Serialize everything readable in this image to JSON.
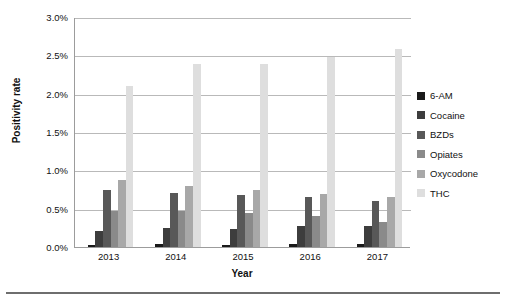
{
  "chart_data": {
    "type": "bar",
    "title": "",
    "xlabel": "Year",
    "ylabel": "Positivity rate",
    "categories": [
      "2013",
      "2014",
      "2015",
      "2016",
      "2017"
    ],
    "ylim": [
      0.0,
      3.0
    ],
    "ytick_values": [
      0.0,
      0.5,
      1.0,
      1.5,
      2.0,
      2.5,
      3.0
    ],
    "ytick_labels": [
      "0.0%",
      "0.5%",
      "1.0%",
      "1.5%",
      "2.0%",
      "2.5%",
      "3.0%"
    ],
    "grid": true,
    "legend_position": "right",
    "series": [
      {
        "name": "6-AM",
        "color": "#1a1a1a",
        "values": [
          0.03,
          0.04,
          0.03,
          0.04,
          0.04
        ]
      },
      {
        "name": "Cocaine",
        "color": "#3d3d3d",
        "values": [
          0.21,
          0.25,
          0.23,
          0.27,
          0.27
        ]
      },
      {
        "name": "BZDs",
        "color": "#585858",
        "values": [
          0.75,
          0.71,
          0.68,
          0.65,
          0.6
        ]
      },
      {
        "name": "Opiates",
        "color": "#8a8a8a",
        "values": [
          0.47,
          0.47,
          0.45,
          0.41,
          0.33
        ]
      },
      {
        "name": "Oxycodone",
        "color": "#a8a8a8",
        "values": [
          0.88,
          0.79,
          0.75,
          0.69,
          0.65
        ]
      },
      {
        "name": "THC",
        "color": "#dedede",
        "values": [
          2.1,
          2.39,
          2.39,
          2.48,
          2.58
        ]
      }
    ]
  },
  "legend": {
    "items": [
      {
        "label": "6-AM"
      },
      {
        "label": "Cocaine"
      },
      {
        "label": "BZDs"
      },
      {
        "label": "Opiates"
      },
      {
        "label": "Oxycodone"
      },
      {
        "label": "THC"
      }
    ]
  }
}
